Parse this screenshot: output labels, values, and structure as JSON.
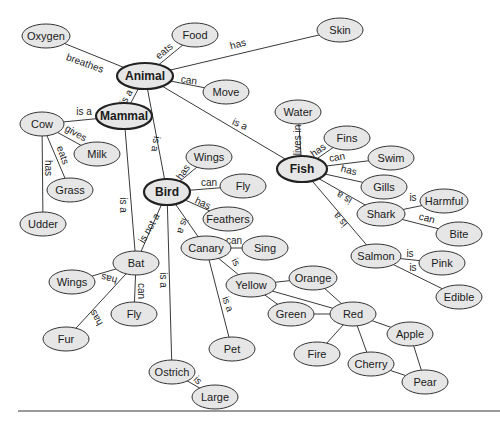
{
  "diagram": {
    "type": "concept-map",
    "nodes": [
      {
        "id": "oxygen",
        "label": "Oxygen",
        "x": 46,
        "y": 36,
        "rx": 24,
        "ry": 12
      },
      {
        "id": "food",
        "label": "Food",
        "x": 195,
        "y": 35,
        "rx": 23,
        "ry": 12
      },
      {
        "id": "skin",
        "label": "Skin",
        "x": 340,
        "y": 30,
        "rx": 23,
        "ry": 12
      },
      {
        "id": "animal",
        "label": "Animal",
        "x": 145,
        "y": 76,
        "rx": 28,
        "ry": 13,
        "main": true
      },
      {
        "id": "move",
        "label": "Move",
        "x": 226,
        "y": 92,
        "rx": 23,
        "ry": 12
      },
      {
        "id": "mammal",
        "label": "Mammal",
        "x": 124,
        "y": 116,
        "rx": 28,
        "ry": 13,
        "main": true
      },
      {
        "id": "cow",
        "label": "Cow",
        "x": 42,
        "y": 124,
        "rx": 22,
        "ry": 12
      },
      {
        "id": "milk",
        "label": "Milk",
        "x": 97,
        "y": 154,
        "rx": 23,
        "ry": 12
      },
      {
        "id": "grass",
        "label": "Grass",
        "x": 70,
        "y": 190,
        "rx": 23,
        "ry": 12
      },
      {
        "id": "udder",
        "label": "Udder",
        "x": 43,
        "y": 224,
        "rx": 23,
        "ry": 12
      },
      {
        "id": "water",
        "label": "Water",
        "x": 298,
        "y": 112,
        "rx": 23,
        "ry": 12
      },
      {
        "id": "fins",
        "label": "Fins",
        "x": 347,
        "y": 138,
        "rx": 23,
        "ry": 12
      },
      {
        "id": "swim",
        "label": "Swim",
        "x": 391,
        "y": 158,
        "rx": 23,
        "ry": 12
      },
      {
        "id": "fish",
        "label": "Fish",
        "x": 302,
        "y": 169,
        "rx": 25,
        "ry": 13,
        "main": true
      },
      {
        "id": "gills",
        "label": "Gills",
        "x": 384,
        "y": 187,
        "rx": 23,
        "ry": 12
      },
      {
        "id": "harmful",
        "label": "Harmful",
        "x": 444,
        "y": 201,
        "rx": 24,
        "ry": 12
      },
      {
        "id": "shark",
        "label": "Shark",
        "x": 381,
        "y": 214,
        "rx": 24,
        "ry": 12
      },
      {
        "id": "bite",
        "label": "Bite",
        "x": 459,
        "y": 234,
        "rx": 23,
        "ry": 12
      },
      {
        "id": "wings_bird",
        "label": "Wings",
        "x": 209,
        "y": 157,
        "rx": 23,
        "ry": 12
      },
      {
        "id": "fly_bird",
        "label": "Fly",
        "x": 243,
        "y": 186,
        "rx": 23,
        "ry": 12
      },
      {
        "id": "bird",
        "label": "Bird",
        "x": 167,
        "y": 192,
        "rx": 23,
        "ry": 13,
        "main": true
      },
      {
        "id": "feathers",
        "label": "Feathers",
        "x": 228,
        "y": 219,
        "rx": 25,
        "ry": 12
      },
      {
        "id": "canary",
        "label": "Canary",
        "x": 206,
        "y": 248,
        "rx": 25,
        "ry": 12
      },
      {
        "id": "sing",
        "label": "Sing",
        "x": 265,
        "y": 248,
        "rx": 23,
        "ry": 12
      },
      {
        "id": "bat",
        "label": "Bat",
        "x": 136,
        "y": 263,
        "rx": 23,
        "ry": 12
      },
      {
        "id": "wings_bat",
        "label": "Wings",
        "x": 72,
        "y": 282,
        "rx": 23,
        "ry": 12
      },
      {
        "id": "fly_bat",
        "label": "Fly",
        "x": 134,
        "y": 314,
        "rx": 23,
        "ry": 12
      },
      {
        "id": "fur",
        "label": "Fur",
        "x": 66,
        "y": 339,
        "rx": 23,
        "ry": 12
      },
      {
        "id": "yellow",
        "label": "Yellow",
        "x": 251,
        "y": 285,
        "rx": 25,
        "ry": 12
      },
      {
        "id": "orange",
        "label": "Orange",
        "x": 313,
        "y": 278,
        "rx": 24,
        "ry": 12
      },
      {
        "id": "green",
        "label": "Green",
        "x": 291,
        "y": 314,
        "rx": 23,
        "ry": 12
      },
      {
        "id": "red",
        "label": "Red",
        "x": 353,
        "y": 314,
        "rx": 23,
        "ry": 12
      },
      {
        "id": "salmon",
        "label": "Salmon",
        "x": 376,
        "y": 256,
        "rx": 25,
        "ry": 12
      },
      {
        "id": "pink",
        "label": "Pink",
        "x": 442,
        "y": 263,
        "rx": 23,
        "ry": 12
      },
      {
        "id": "edible",
        "label": "Edible",
        "x": 459,
        "y": 297,
        "rx": 23,
        "ry": 12
      },
      {
        "id": "apple",
        "label": "Apple",
        "x": 410,
        "y": 334,
        "rx": 23,
        "ry": 12
      },
      {
        "id": "fire",
        "label": "Fire",
        "x": 317,
        "y": 354,
        "rx": 23,
        "ry": 12
      },
      {
        "id": "cherry",
        "label": "Cherry",
        "x": 371,
        "y": 364,
        "rx": 23,
        "ry": 12
      },
      {
        "id": "pet",
        "label": "Pet",
        "x": 232,
        "y": 349,
        "rx": 23,
        "ry": 12
      },
      {
        "id": "pear",
        "label": "Pear",
        "x": 425,
        "y": 382,
        "rx": 23,
        "ry": 12
      },
      {
        "id": "ostrich",
        "label": "Ostrich",
        "x": 172,
        "y": 372,
        "rx": 23,
        "ry": 12
      },
      {
        "id": "large",
        "label": "Large",
        "x": 215,
        "y": 397,
        "rx": 23,
        "ry": 12
      }
    ],
    "edges": [
      {
        "from": "animal",
        "to": "oxygen",
        "label": "breathes",
        "lx": 85,
        "ly": 63,
        "rot": 20
      },
      {
        "from": "animal",
        "to": "food",
        "label": "eats",
        "lx": 164,
        "ly": 51,
        "rot": -40
      },
      {
        "from": "animal",
        "to": "skin",
        "label": "has",
        "lx": 238,
        "ly": 44,
        "rot": -15
      },
      {
        "from": "animal",
        "to": "move",
        "label": "can",
        "lx": 189,
        "ly": 80,
        "rot": 8
      },
      {
        "from": "animal",
        "to": "mammal",
        "label": "is a",
        "lx": 126,
        "ly": 97,
        "rot": -60
      },
      {
        "from": "animal",
        "to": "fish",
        "label": "is a",
        "lx": 240,
        "ly": 124,
        "rot": 25
      },
      {
        "from": "animal",
        "to": "bird",
        "label": "is a",
        "lx": 156,
        "ly": 144,
        "rot": 100
      },
      {
        "from": "mammal",
        "to": "cow",
        "label": "is a",
        "lx": 84,
        "ly": 111,
        "rot": 0
      },
      {
        "from": "cow",
        "to": "milk",
        "label": "gives",
        "lx": 76,
        "ly": 133,
        "rot": 30
      },
      {
        "from": "cow",
        "to": "grass",
        "label": "eats",
        "lx": 63,
        "ly": 155,
        "rot": 70
      },
      {
        "from": "cow",
        "to": "udder",
        "label": "has",
        "lx": 48,
        "ly": 168,
        "rot": 90
      },
      {
        "from": "mammal",
        "to": "bat",
        "label": "is a",
        "lx": 123,
        "ly": 205,
        "rot": 90
      },
      {
        "from": "bird",
        "to": "bat",
        "label": "is not a",
        "lx": 149,
        "ly": 228,
        "rot": -60
      },
      {
        "from": "fish",
        "to": "water",
        "label": "lives in",
        "lx": 297,
        "ly": 140,
        "rot": -90
      },
      {
        "from": "fish",
        "to": "fins",
        "label": "has",
        "lx": 318,
        "ly": 150,
        "rot": -35
      },
      {
        "from": "fish",
        "to": "swim",
        "label": "can",
        "lx": 337,
        "ly": 157,
        "rot": -10
      },
      {
        "from": "fish",
        "to": "gills",
        "label": "has",
        "lx": 349,
        "ly": 170,
        "rot": 15
      },
      {
        "from": "fish",
        "to": "shark",
        "label": "is a",
        "lx": 344,
        "ly": 198,
        "rot": 210
      },
      {
        "from": "fish",
        "to": "salmon",
        "label": "is a",
        "lx": 340,
        "ly": 220,
        "rot": 230
      },
      {
        "from": "shark",
        "to": "harmful",
        "label": "is",
        "lx": 413,
        "ly": 197,
        "rot": 0
      },
      {
        "from": "shark",
        "to": "bite",
        "label": "can",
        "lx": 427,
        "ly": 218,
        "rot": 15
      },
      {
        "from": "salmon",
        "to": "pink",
        "label": "is",
        "lx": 410,
        "ly": 253,
        "rot": 0
      },
      {
        "from": "salmon",
        "to": "edible",
        "label": "is",
        "lx": 413,
        "ly": 267,
        "rot": 0
      },
      {
        "from": "bird",
        "to": "wings_bird",
        "label": "has",
        "lx": 183,
        "ly": 172,
        "rot": -55
      },
      {
        "from": "bird",
        "to": "fly_bird",
        "label": "can",
        "lx": 209,
        "ly": 182,
        "rot": 0
      },
      {
        "from": "bird",
        "to": "feathers",
        "label": "has",
        "lx": 203,
        "ly": 203,
        "rot": 25
      },
      {
        "from": "bird",
        "to": "canary",
        "label": "is a",
        "lx": 183,
        "ly": 226,
        "rot": 110
      },
      {
        "from": "bird",
        "to": "ostrich",
        "label": "is a",
        "lx": 163,
        "ly": 280,
        "rot": 90
      },
      {
        "from": "canary",
        "to": "sing",
        "label": "can",
        "lx": 234,
        "ly": 240,
        "rot": 0
      },
      {
        "from": "canary",
        "to": "yellow",
        "label": "is",
        "lx": 236,
        "ly": 262,
        "rot": 60
      },
      {
        "from": "canary",
        "to": "pet",
        "label": "is a",
        "lx": 228,
        "ly": 304,
        "rot": 70
      },
      {
        "from": "bat",
        "to": "wings_bat",
        "label": "has",
        "lx": 109,
        "ly": 279,
        "rot": 195
      },
      {
        "from": "bat",
        "to": "fly_bat",
        "label": "can",
        "lx": 141,
        "ly": 291,
        "rot": 90
      },
      {
        "from": "bat",
        "to": "fur",
        "label": "has",
        "lx": 96,
        "ly": 318,
        "rot": 240
      },
      {
        "from": "ostrich",
        "to": "large",
        "label": "is",
        "lx": 198,
        "ly": 380,
        "rot": 45
      },
      {
        "from": "yellow",
        "to": "orange",
        "label": ""
      },
      {
        "from": "yellow",
        "to": "green",
        "label": ""
      },
      {
        "from": "yellow",
        "to": "red",
        "label": ""
      },
      {
        "from": "orange",
        "to": "red",
        "label": ""
      },
      {
        "from": "green",
        "to": "red",
        "label": ""
      },
      {
        "from": "red",
        "to": "fire",
        "label": ""
      },
      {
        "from": "red",
        "to": "cherry",
        "label": ""
      },
      {
        "from": "red",
        "to": "apple",
        "label": ""
      },
      {
        "from": "apple",
        "to": "pear",
        "label": ""
      },
      {
        "from": "cherry",
        "to": "pear",
        "label": ""
      }
    ]
  },
  "colors": {
    "node_fill": "#e6e6e6",
    "node_stroke": "#333333",
    "edge": "#3a3a3a",
    "baseline": "#9a9a9a"
  }
}
